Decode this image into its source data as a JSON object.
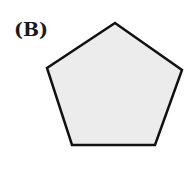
{
  "figure": {
    "label": "(B)",
    "shape": {
      "type": "regular-pentagon",
      "vertices": [
        [
          115,
          23
        ],
        [
          182,
          70
        ],
        [
          155,
          145
        ],
        [
          72,
          145
        ],
        [
          47,
          68
        ]
      ],
      "fill": "#ececec",
      "stroke": "#111111",
      "stroke_width": 2.5
    }
  }
}
